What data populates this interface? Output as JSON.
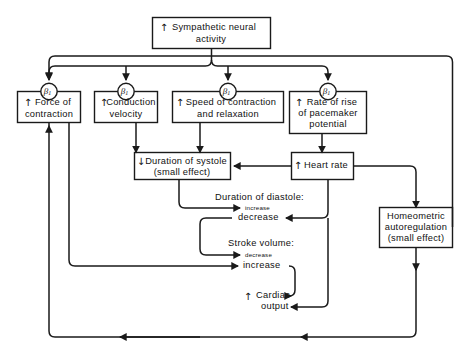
{
  "diagram": {
    "nodes": {
      "sympathetic": {
        "label_line1": "Sympathetic neural",
        "label_line2": "activity",
        "direction": "up"
      },
      "force": {
        "label_line1": "Force of",
        "label_line2": "contraction",
        "direction": "up",
        "receptor": "beta1"
      },
      "conduction": {
        "label_line1": "Conduction",
        "label_line2": "velocity",
        "direction": "up",
        "receptor": "beta1"
      },
      "speed": {
        "label_line1": "Speed of contraction",
        "label_line2": "and relaxation",
        "direction": "up",
        "receptor": "beta1"
      },
      "pacemaker": {
        "label_line1": "Rate of rise",
        "label_line2": "of pacemaker",
        "label_line3": "potential",
        "direction": "up",
        "receptor": "beta1"
      },
      "systole": {
        "label_line1": "Duration of systole",
        "label_line2": "(small effect)",
        "direction": "down"
      },
      "heart_rate": {
        "label_line1": "Heart rate",
        "direction": "up"
      },
      "homeometric": {
        "label_line1": "Homeometric",
        "label_line2": "autoregulation",
        "label_line3": "(small effect)",
        "direction": "none"
      },
      "cardiac_output": {
        "label_line1": "Cardiac",
        "label_line2": "output",
        "direction": "up"
      }
    },
    "free_labels": {
      "diastole_title": "Duration of diastole:",
      "diastole_increase": "increase",
      "diastole_decrease": "decrease",
      "stroke_volume_title": "Stroke volume:",
      "stroke_volume_decrease": "decrease",
      "stroke_volume_increase": "increase"
    },
    "receptor_symbol": {
      "greek": "β",
      "subscript": "1"
    },
    "glyphs": {
      "arrow_up": "↑",
      "arrow_down": "↓"
    },
    "colors": {
      "ink": "#1a1a1a",
      "paper": "#ffffff"
    }
  }
}
